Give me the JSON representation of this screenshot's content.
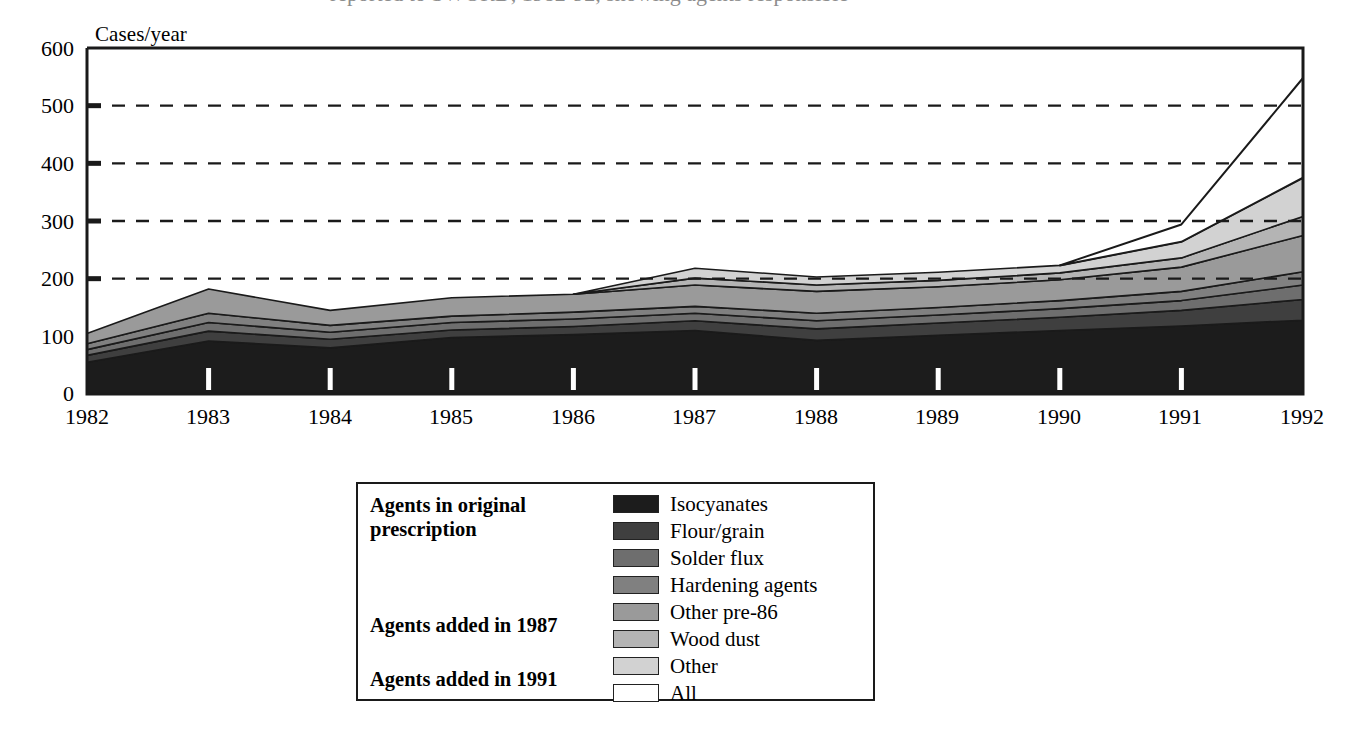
{
  "figure": {
    "clipped_title": "reported to SWORD, 1982-92, showing agents responsible"
  },
  "axes": {
    "y_axis_title": "Cases/year",
    "y_ticks": [
      "600",
      "500",
      "400",
      "300",
      "200",
      "100",
      "0"
    ],
    "y_tick_values": [
      600,
      500,
      400,
      300,
      200,
      100,
      0
    ],
    "gridline_values": [
      500,
      400,
      300,
      200
    ],
    "x_ticks": [
      "1982",
      "1983",
      "1984",
      "1985",
      "1986",
      "1987",
      "1988",
      "1989",
      "1990",
      "1991",
      "1992"
    ]
  },
  "legend": {
    "groups": [
      {
        "label": "Agents in original prescription",
        "line1": "Agents in original",
        "line2": "prescription"
      },
      {
        "label": "Agents added in 1987"
      },
      {
        "label": "Agents added in 1991"
      }
    ],
    "entries": [
      {
        "name": "Isocyanates",
        "color": "#1c1c1c"
      },
      {
        "name": "Flour/grain",
        "color": "#3f3f3f"
      },
      {
        "name": "Solder flux",
        "color": "#6e6e6e"
      },
      {
        "name": "Hardening agents",
        "color": "#808080"
      },
      {
        "name": "Other pre-86",
        "color": "#9a9a9a"
      },
      {
        "name": "Wood dust",
        "color": "#b4b4b4"
      },
      {
        "name": "Other",
        "color": "#d2d2d2"
      },
      {
        "name": "All",
        "color": "#ffffff"
      }
    ]
  },
  "chart_data": {
    "type": "area",
    "stacked": true,
    "title": "",
    "xlabel": "",
    "ylabel": "Cases/year",
    "xlim": [
      1982,
      1992
    ],
    "ylim": [
      0,
      600
    ],
    "grid": true,
    "grid_axis": "y",
    "legend_position": "below-center",
    "x": [
      1982,
      1983,
      1984,
      1985,
      1986,
      1987,
      1988,
      1989,
      1990,
      1991,
      1992
    ],
    "series": [
      {
        "name": "Isocyanates",
        "color": "#1c1c1c",
        "values": [
          55,
          92,
          80,
          98,
          103,
          110,
          93,
          102,
          110,
          118,
          128
        ]
      },
      {
        "name": "Flour/grain",
        "color": "#3f3f3f",
        "values": [
          12,
          17,
          15,
          13,
          14,
          17,
          20,
          21,
          23,
          27,
          36
        ]
      },
      {
        "name": "Solder flux",
        "color": "#6e6e6e",
        "values": [
          10,
          15,
          12,
          13,
          13,
          13,
          14,
          14,
          15,
          17,
          25
        ]
      },
      {
        "name": "Hardening agents",
        "color": "#808080",
        "values": [
          10,
          16,
          12,
          11,
          12,
          12,
          13,
          13,
          14,
          16,
          23
        ]
      },
      {
        "name": "Other pre-86",
        "color": "#9a9a9a",
        "values": [
          18,
          42,
          26,
          32,
          31,
          37,
          38,
          36,
          36,
          42,
          63
        ]
      },
      {
        "name": "Wood dust",
        "color": "#b4b4b4",
        "values": [
          0,
          0,
          0,
          0,
          0,
          12,
          11,
          11,
          12,
          16,
          33
        ]
      },
      {
        "name": "Other",
        "color": "#d2d2d2",
        "values": [
          0,
          0,
          0,
          0,
          0,
          17,
          14,
          14,
          13,
          28,
          67
        ]
      },
      {
        "name": "All",
        "color": "#ffffff",
        "values": [
          0,
          0,
          0,
          0,
          0,
          0,
          0,
          0,
          0,
          30,
          173
        ]
      }
    ],
    "cumulative_totals": [
      105,
      182,
      145,
      167,
      173,
      218,
      203,
      211,
      223,
      294,
      548
    ]
  }
}
